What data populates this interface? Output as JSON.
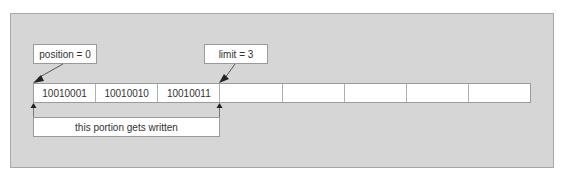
{
  "diagram": {
    "position_label": "position = 0",
    "limit_label": "limit = 3",
    "written_label": "this portion gets written",
    "cells": [
      {
        "value": "10010001"
      },
      {
        "value": "10010010"
      },
      {
        "value": "10010011"
      },
      {
        "value": ""
      },
      {
        "value": ""
      },
      {
        "value": ""
      },
      {
        "value": ""
      },
      {
        "value": ""
      }
    ],
    "colors": {
      "panel_bg": "#d6d6d6",
      "box_bg": "#ffffff",
      "border": "#9a9a9a",
      "arrow": "#222222",
      "text": "#333333"
    }
  }
}
